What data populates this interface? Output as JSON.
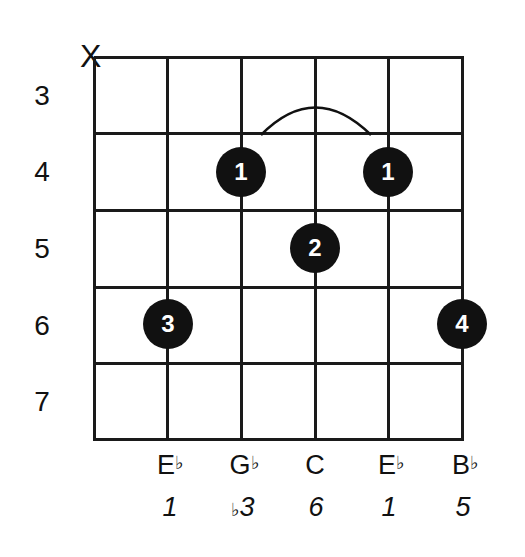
{
  "chord_diagram": {
    "muted_string": "X",
    "fret_numbers": [
      "3",
      "4",
      "5",
      "6",
      "7"
    ],
    "fingers": [
      {
        "string": 3,
        "fret": 4,
        "finger": "1"
      },
      {
        "string": 5,
        "fret": 4,
        "finger": "1"
      },
      {
        "string": 4,
        "fret": 5,
        "finger": "2"
      },
      {
        "string": 2,
        "fret": 6,
        "finger": "3"
      },
      {
        "string": 6,
        "fret": 6,
        "finger": "4"
      }
    ],
    "barre": {
      "from_string": 3,
      "to_string": 5,
      "fret": 4
    },
    "notes": [
      {
        "letter": "E",
        "accidental": "♭"
      },
      {
        "letter": "G",
        "accidental": "♭"
      },
      {
        "letter": "C",
        "accidental": ""
      },
      {
        "letter": "E",
        "accidental": "♭"
      },
      {
        "letter": "B",
        "accidental": "♭"
      }
    ],
    "intervals": [
      {
        "accidental": "",
        "degree": "1"
      },
      {
        "accidental": "♭",
        "degree": "3"
      },
      {
        "accidental": "",
        "degree": "6"
      },
      {
        "accidental": "",
        "degree": "1"
      },
      {
        "accidental": "",
        "degree": "5"
      }
    ]
  }
}
